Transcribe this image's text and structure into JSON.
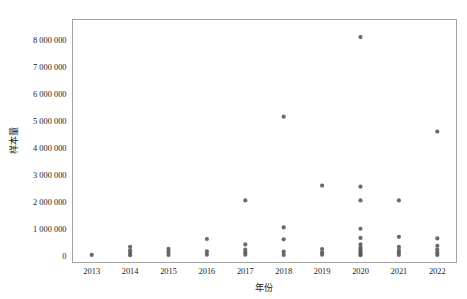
{
  "chart_data": {
    "type": "scatter",
    "title": "",
    "xlabel": "年份",
    "ylabel": "样本量",
    "grid": false,
    "legend": "none",
    "marker": {
      "shape": "circle",
      "color": "#54545a",
      "radius_px": 2.1,
      "opacity": 0.88
    },
    "categories": [
      "2013",
      "2014",
      "2015",
      "2016",
      "2017",
      "2018",
      "2019",
      "2020",
      "2021",
      "2022"
    ],
    "xtick_labels": [
      "2013",
      "2014",
      "2015",
      "2016",
      "2017",
      "2018",
      "2019",
      "2020",
      "2021",
      "2022"
    ],
    "ytick_labels": [
      "0",
      "1 000 000",
      "2 000 000",
      "3 000 000",
      "4 000 000",
      "5 000 000",
      "6 000 000",
      "7 000 000",
      "8 000 000"
    ],
    "ytick_values": [
      0,
      1000000,
      2000000,
      3000000,
      4000000,
      5000000,
      6000000,
      7000000,
      8000000
    ],
    "ylim": [
      -250000,
      8750000
    ],
    "series": [
      {
        "name": "样本量",
        "points": [
          {
            "x": "2013",
            "y": 30000
          },
          {
            "x": "2014",
            "y": 20000
          },
          {
            "x": "2014",
            "y": 110000
          },
          {
            "x": "2014",
            "y": 200000
          },
          {
            "x": "2014",
            "y": 330000
          },
          {
            "x": "2015",
            "y": 30000
          },
          {
            "x": "2015",
            "y": 140000
          },
          {
            "x": "2015",
            "y": 260000
          },
          {
            "x": "2016",
            "y": 40000
          },
          {
            "x": "2016",
            "y": 160000
          },
          {
            "x": "2016",
            "y": 620000
          },
          {
            "x": "2017",
            "y": 40000
          },
          {
            "x": "2017",
            "y": 130000
          },
          {
            "x": "2017",
            "y": 230000
          },
          {
            "x": "2017",
            "y": 420000
          },
          {
            "x": "2017",
            "y": 2050000
          },
          {
            "x": "2018",
            "y": 30000
          },
          {
            "x": "2018",
            "y": 150000
          },
          {
            "x": "2018",
            "y": 610000
          },
          {
            "x": "2018",
            "y": 1050000
          },
          {
            "x": "2018",
            "y": 5150000
          },
          {
            "x": "2019",
            "y": 40000
          },
          {
            "x": "2019",
            "y": 130000
          },
          {
            "x": "2019",
            "y": 250000
          },
          {
            "x": "2019",
            "y": 2600000
          },
          {
            "x": "2020",
            "y": 20000
          },
          {
            "x": "2020",
            "y": 80000
          },
          {
            "x": "2020",
            "y": 150000
          },
          {
            "x": "2020",
            "y": 220000
          },
          {
            "x": "2020",
            "y": 300000
          },
          {
            "x": "2020",
            "y": 420000
          },
          {
            "x": "2020",
            "y": 660000
          },
          {
            "x": "2020",
            "y": 1000000
          },
          {
            "x": "2020",
            "y": 2050000
          },
          {
            "x": "2020",
            "y": 2560000
          },
          {
            "x": "2020",
            "y": 8100000
          },
          {
            "x": "2021",
            "y": 30000
          },
          {
            "x": "2021",
            "y": 120000
          },
          {
            "x": "2021",
            "y": 210000
          },
          {
            "x": "2021",
            "y": 330000
          },
          {
            "x": "2021",
            "y": 700000
          },
          {
            "x": "2021",
            "y": 2050000
          },
          {
            "x": "2022",
            "y": 30000
          },
          {
            "x": "2022",
            "y": 120000
          },
          {
            "x": "2022",
            "y": 230000
          },
          {
            "x": "2022",
            "y": 370000
          },
          {
            "x": "2022",
            "y": 640000
          },
          {
            "x": "2022",
            "y": 4600000
          }
        ]
      }
    ]
  },
  "axes": {
    "y_title": "样本量",
    "x_title": "年份"
  }
}
